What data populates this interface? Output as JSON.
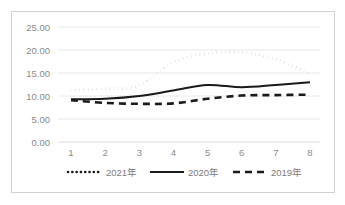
{
  "chart_data": {
    "type": "line",
    "title": "",
    "xlabel": "",
    "ylabel": "",
    "x": [
      1,
      2,
      3,
      4,
      5,
      6,
      7,
      8
    ],
    "categories": [
      "1",
      "2",
      "3",
      "4",
      "5",
      "6",
      "7",
      "8"
    ],
    "ylim": [
      0,
      25
    ],
    "ytick_labels": [
      "0.00",
      "5.00",
      "10.00",
      "15.00",
      "20.00",
      "25.00"
    ],
    "ytick_values": [
      0,
      5,
      10,
      15,
      20,
      25
    ],
    "grid": true,
    "legend_position": "bottom",
    "series": [
      {
        "name": "2021年",
        "style": "dotted",
        "color": "#1a1a1a",
        "values": [
          11.2,
          11.6,
          12.3,
          17.4,
          19.2,
          19.5,
          18.0,
          14.8
        ]
      },
      {
        "name": "2020年",
        "style": "solid",
        "color": "#1a1a1a",
        "values": [
          9.3,
          9.4,
          10.0,
          11.2,
          12.4,
          11.9,
          12.4,
          13.0
        ]
      },
      {
        "name": "2019年",
        "style": "dashed",
        "color": "#1a1a1a",
        "values": [
          9.1,
          8.5,
          8.3,
          8.4,
          9.4,
          10.1,
          10.2,
          10.3
        ]
      }
    ]
  },
  "legend": {
    "items": [
      {
        "label": "2021年",
        "style": "dotted"
      },
      {
        "label": "2020年",
        "style": "solid"
      },
      {
        "label": "2019年",
        "style": "dashed"
      }
    ]
  }
}
